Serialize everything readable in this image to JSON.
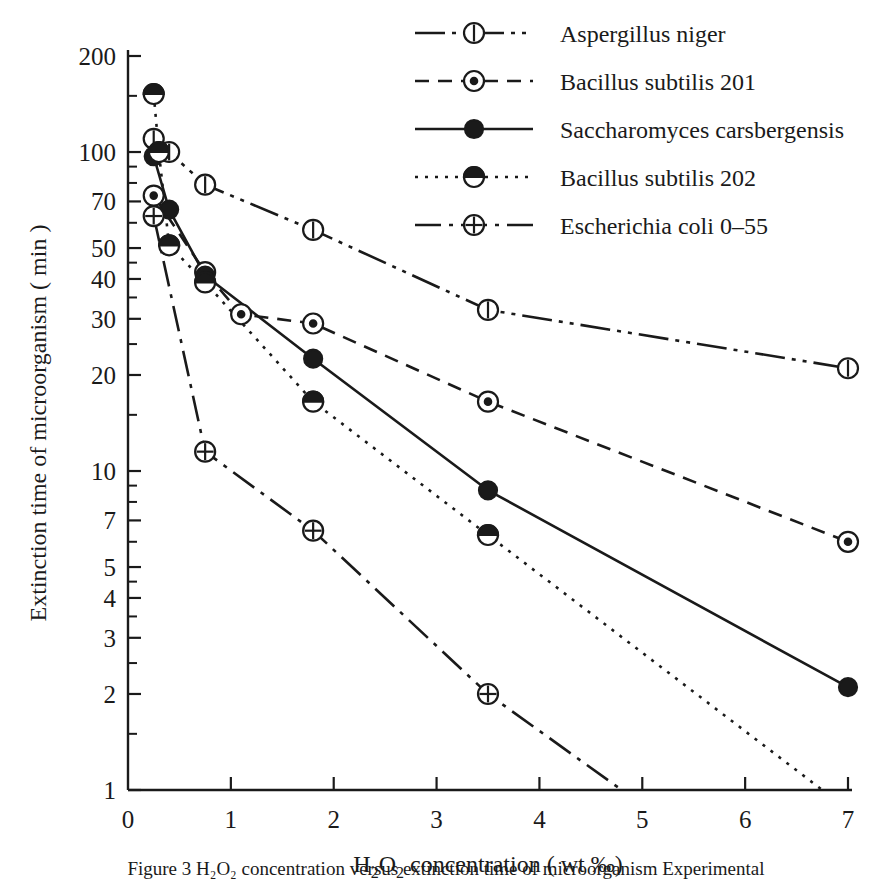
{
  "chart_data": {
    "type": "line",
    "title": "",
    "xlabel": "H₂O₂ concentration ( wt ‰)",
    "ylabel": "Extinction time of microorganism ( min )",
    "xlim": [
      0,
      7
    ],
    "ylim": [
      1,
      200
    ],
    "yscale": "log",
    "xscale": "linear",
    "grid": false,
    "legend_position": "top-right",
    "xticks": [
      "0",
      "1",
      "2",
      "3",
      "4",
      "5",
      "6",
      "7"
    ],
    "xtick_values": [
      0,
      1,
      2,
      3,
      4,
      5,
      6,
      7
    ],
    "yticks": [
      "200",
      "100",
      "70",
      "50",
      "40",
      "30",
      "20",
      "10",
      "7",
      "5",
      "4",
      "3",
      "2",
      "1"
    ],
    "ytick_values": [
      200,
      100,
      70,
      50,
      40,
      30,
      20,
      10,
      7,
      5,
      4,
      3,
      2,
      1
    ],
    "series": [
      {
        "name": "Aspergillus  niger",
        "marker": "circle-vertical-bar",
        "linestyle": "dash-dot-dot",
        "x": [
          0.25,
          0.4,
          0.75,
          1.8,
          3.5,
          7.0
        ],
        "y": [
          110,
          100,
          79,
          57,
          32,
          21
        ]
      },
      {
        "name": "Bacillus  subtilis  201",
        "marker": "circle-dot",
        "linestyle": "dashed",
        "x": [
          0.25,
          0.75,
          1.1,
          1.8,
          3.5,
          7.0
        ],
        "y": [
          73,
          42,
          31,
          29,
          16.5,
          6.0
        ]
      },
      {
        "name": "Saccharomyces  carsbergensis",
        "marker": "circle-filled",
        "linestyle": "solid",
        "x": [
          0.25,
          0.4,
          0.75,
          1.8,
          3.5,
          7.0
        ],
        "y": [
          97,
          66,
          41,
          22.5,
          8.7,
          2.1
        ]
      },
      {
        "name": "Bacillus  subtilis  202",
        "marker": "circle-half-filled",
        "linestyle": "dotted",
        "x": [
          0.25,
          0.3,
          0.4,
          0.75,
          1.8,
          3.5,
          6.75
        ],
        "y": [
          152,
          100,
          51,
          39,
          16.5,
          6.3,
          1.0
        ]
      },
      {
        "name": "Escherichia  coli  0–55",
        "marker": "circle-plus",
        "linestyle": "dash-dot",
        "x": [
          0.25,
          0.75,
          1.8,
          3.5,
          4.8
        ],
        "y": [
          63,
          11.5,
          6.5,
          2.0,
          1.0
        ]
      }
    ]
  },
  "axes": {
    "y_title": "Extinction time of microorganism ( min )",
    "x_title": "H₂ O₂  concentration ( wt  ‰)",
    "x_title_parts": {
      "h": "H",
      "sub2a": "2",
      "o": "O",
      "sub2b": "2",
      "rest": "concentration ( wt  ‰)"
    }
  },
  "legend": {
    "items": [
      {
        "label": "Aspergillus  niger",
        "key": "aspergillus"
      },
      {
        "label": "Bacillus  subtilis  201",
        "key": "bacillus201"
      },
      {
        "label": "Saccharomyces  carsbergensis",
        "key": "saccharomyces"
      },
      {
        "label": "Bacillus  subtilis  202",
        "key": "bacillus202"
      },
      {
        "label": "Escherichia  coli  0–55",
        "key": "ecoli"
      }
    ]
  },
  "caption": {
    "text": "Figure 3   H₂O₂ concentration versus extinction time of microorganism   Experimental"
  },
  "colors": {
    "ink": "#1a1a1a",
    "paper": "#ffffff"
  }
}
